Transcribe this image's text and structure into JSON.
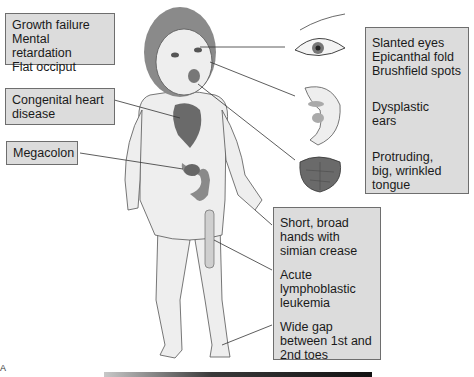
{
  "diagram": {
    "labels": {
      "left_top": [
        "Growth failure",
        "Mental retardation",
        "Flat occiput"
      ],
      "left_mid": [
        "Congenital heart",
        "disease"
      ],
      "left_low": [
        "Megacolon"
      ],
      "right_top": {
        "eyes": [
          "Slanted eyes",
          "Epicanthal fold",
          "Brushfield spots"
        ],
        "ears": [
          "Dysplastic",
          "ears"
        ],
        "tongue": [
          "Protruding,",
          "big, wrinkled",
          "tongue"
        ]
      },
      "right_bottom": {
        "hands": [
          "Short, broad",
          "hands with",
          "simian crease"
        ],
        "leukemia": [
          "Acute",
          "lymphoblastic",
          "leukemia"
        ],
        "toes": [
          "Wide gap",
          "between 1st and",
          "2nd toes"
        ]
      }
    },
    "panel_letter": "A",
    "colors": {
      "box_fill": "#dcdcdc",
      "box_border": "#6e6e6e",
      "organ": "#6a6a6a",
      "skin": "#eeeeee",
      "hair": "#8a8a8a"
    }
  }
}
